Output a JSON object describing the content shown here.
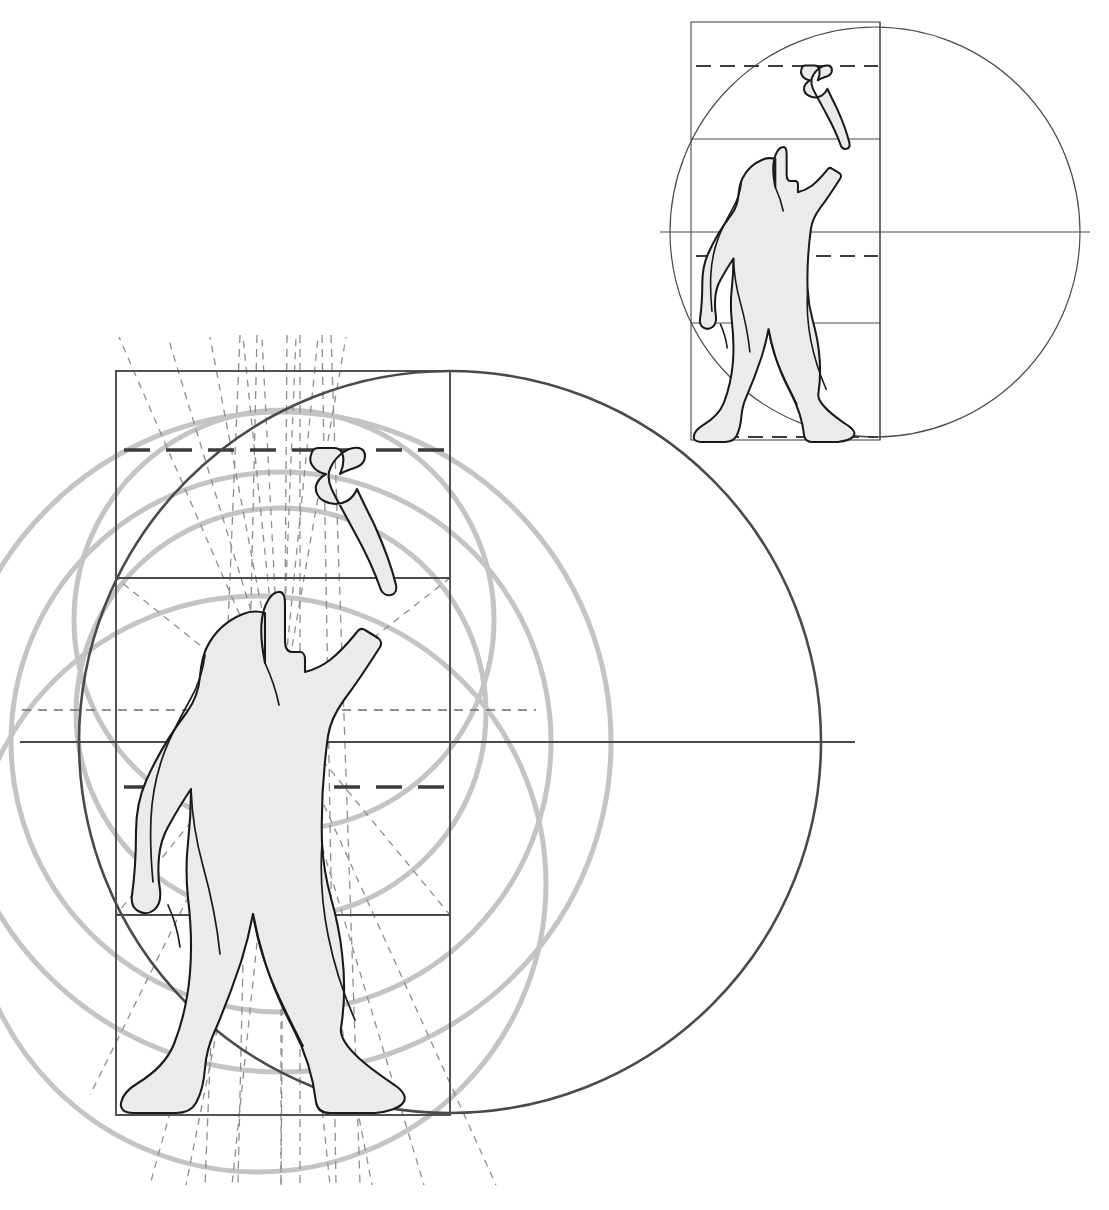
{
  "document": {
    "title": "Canon of Human Proportions — Geometric Construction Diagram",
    "background_color": "#ffffff",
    "width": 1109,
    "height": 1210
  },
  "palette": {
    "figure_fill": "#ebebeb",
    "figure_outline": "#1a1a1a",
    "frame_line": "#4a4a4a",
    "major_circle": "#4a4a4a",
    "light_circle": "#c4c4c4",
    "dashed_light": "#8a8a8a",
    "dashed_heavy": "#3c3c3c"
  },
  "panels": [
    {
      "id": "main-panel",
      "name": "Main construction — large scale",
      "label": "Large proportional construction of standing male figure with raised right arm",
      "frame": {
        "x": 116,
        "y": 371,
        "width": 334,
        "height": 744
      },
      "divisions_y": [
        371,
        578,
        915,
        1115
      ],
      "dashed_rules_y": [
        450,
        710,
        787
      ],
      "axis_horizontal_y": 742,
      "axis_horizontal_extent": {
        "x1": 20,
        "x2": 855
      },
      "radiant_center": {
        "x": 281,
        "y": 710
      },
      "major_circle": {
        "cx": 450,
        "cy": 742,
        "r": 371,
        "stroke": "#4a4a4a",
        "stroke_width": 2.6
      },
      "light_circles": [
        {
          "cx": 281,
          "cy": 713,
          "r": 205,
          "note": "inner torso circle"
        },
        {
          "cx": 281,
          "cy": 742,
          "r": 270,
          "note": "mid circle"
        },
        {
          "cx": 284,
          "cy": 620,
          "r": 210,
          "note": "upper circle"
        },
        {
          "cx": 258,
          "cy": 884,
          "r": 288,
          "note": "lower-left large circle"
        },
        {
          "cx": 281,
          "cy": 742,
          "r": 330,
          "note": "outer light circle"
        }
      ],
      "vertical_dashed_guides_x": [
        140,
        168,
        206,
        238,
        253,
        281,
        299,
        320,
        332,
        371,
        402,
        430,
        462,
        492
      ]
    },
    {
      "id": "inset-panel",
      "name": "Inset construction — reduced scale",
      "label": "Small-scale repeat of the same construction at upper right",
      "frame": {
        "x": 691,
        "y": 22,
        "width": 189,
        "height": 418
      },
      "divisions_y": [
        22,
        139,
        323,
        440
      ],
      "dashed_rules_y": [
        66,
        256,
        437
      ],
      "axis_horizontal_y": 232,
      "axis_horizontal_extent": {
        "x1": 660,
        "x2": 1090
      },
      "major_circle": {
        "cx": 875,
        "cy": 232,
        "r": 205,
        "stroke": "#4a4a4a",
        "stroke_width": 1.2
      },
      "vertical_divider_x": 880
    }
  ],
  "figure": {
    "name": "standing-male-figure",
    "pose": "standing, right arm raised with clenched fist, legs apart in stride",
    "fill": "#ebebeb",
    "outline": "#1a1a1a"
  },
  "chart_data": {
    "type": "diagram",
    "title": "Canon of Human Proportions — Geometric Construction Diagram",
    "xlabel": "",
    "ylabel": "",
    "annotations": [
      "Large circle circumscribes the figure's stride and reach",
      "Rectangle subdivided into head, torso and leg registers",
      "Radiating dashed rays converge at the navel point",
      "Nested light circles mark harmonic subdivisions",
      "Small inset repeats the whole construction at reduced scale"
    ]
  }
}
